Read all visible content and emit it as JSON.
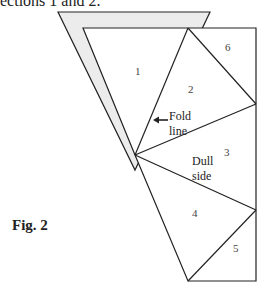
{
  "caption_top": "ections 1 and 2.",
  "figure_label": "Fig. 2",
  "sections": [
    {
      "id": "1",
      "label": "1"
    },
    {
      "id": "2",
      "label": "2"
    },
    {
      "id": "3",
      "label": "3"
    },
    {
      "id": "4",
      "label": "4"
    },
    {
      "id": "5",
      "label": "5"
    },
    {
      "id": "6",
      "label": "6"
    }
  ],
  "annotations": {
    "fold_line_1": "Fold",
    "fold_line_2": "line",
    "dull_side_1": "Dull",
    "dull_side_2": "side"
  },
  "colors": {
    "shadow_fill": "#ececec",
    "line": "#222222"
  }
}
